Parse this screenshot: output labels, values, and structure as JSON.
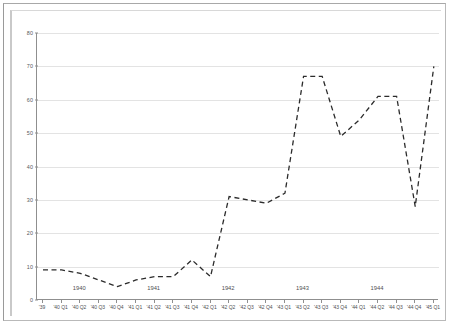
{
  "chart_data": {
    "type": "line",
    "title": "",
    "subtitle": "",
    "xlabel": "",
    "ylabel": "",
    "ylim": [
      0,
      80
    ],
    "yticks": [
      0,
      10,
      20,
      30,
      40,
      50,
      60,
      70,
      80
    ],
    "ytick_labels": [
      "0",
      "10",
      "20",
      "30",
      "40",
      "50",
      "60",
      "70",
      "80"
    ],
    "grid": true,
    "legend": "none",
    "line_style": "dashed",
    "line_color": "#2b2b2b",
    "markers": false,
    "categories": [
      "'39",
      "'40 Q1",
      "'40 Q2",
      "'40 Q3",
      "'40 Q4",
      "'41 Q1",
      "'41 Q2",
      "'41 Q3",
      "'41 Q4",
      "'42 Q1",
      "'42 Q2",
      "'42 Q3",
      "'42 Q4",
      "'43 Q1",
      "'43 Q2",
      "'43 Q3",
      "'43 Q4",
      "'44 Q1",
      "'44 Q2",
      "'44 Q3",
      "'44 Q4",
      "'45 Q1"
    ],
    "values": [
      9,
      9,
      8,
      6,
      4,
      6,
      7,
      7,
      12,
      7,
      31,
      30,
      29,
      32,
      67,
      67,
      49,
      54,
      61,
      61,
      28,
      70
    ],
    "group_labels": [
      {
        "label": "1940",
        "center_category": "'40 Q2"
      },
      {
        "label": "1941",
        "center_category": "'41 Q2"
      },
      {
        "label": "1942",
        "center_category": "'42 Q2"
      },
      {
        "label": "1943",
        "center_category": "'43 Q2"
      },
      {
        "label": "1944",
        "center_category": "'44 Q2"
      }
    ]
  }
}
